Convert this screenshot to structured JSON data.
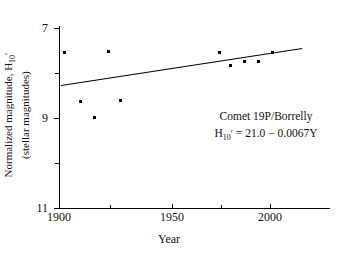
{
  "chart_data": {
    "type": "scatter",
    "title": "",
    "xlabel": "Year",
    "ylabel": "Normalized magnitude, H10' (stellar magnitudes)",
    "ylabel_line1": "Normalized magnitude, H",
    "ylabel_line1_sub": "10",
    "ylabel_line1_prime": "′",
    "ylabel_line2": "(stellar magnitudes)",
    "xlim": [
      1900,
      2022
    ],
    "ylim": [
      11,
      7
    ],
    "y_inverted": true,
    "grid": false,
    "legend": "none",
    "x_major_ticks": [
      1900,
      1950,
      2000
    ],
    "x_minor_ticks": [
      1925,
      1975
    ],
    "y_major_ticks": [
      7,
      9,
      11
    ],
    "y_minor_ticks": [
      8,
      10
    ],
    "x_tick_labels": [
      "1900",
      "1950",
      "2000"
    ],
    "y_tick_labels": [
      "7",
      "9",
      "11"
    ],
    "series": [
      {
        "name": "Normalized magnitude observations",
        "marker": "square",
        "color": "#000000",
        "points": [
          {
            "x": 1903,
            "y": 7.55
          },
          {
            "x": 1911,
            "y": 8.63
          },
          {
            "x": 1918,
            "y": 8.98
          },
          {
            "x": 1925,
            "y": 7.53
          },
          {
            "x": 1931,
            "y": 8.62
          },
          {
            "x": 1981,
            "y": 7.55
          },
          {
            "x": 1987,
            "y": 7.83
          },
          {
            "x": 1994,
            "y": 7.75
          },
          {
            "x": 2001,
            "y": 7.74
          },
          {
            "x": 2008,
            "y": 7.55
          }
        ]
      }
    ],
    "fit_line": {
      "name": "Linear regression",
      "equation": "H10' = 21.0 - 0.0067Y",
      "intercept": 21.0,
      "slope": -0.0067,
      "x_start": 1901,
      "x_end": 2023,
      "y_start": 8.27,
      "y_end": 7.45
    },
    "annotations": {
      "comet_name": "Comet 19P/Borrelly",
      "equation_lhs": "H",
      "equation_sub": "10",
      "equation_prime": "′",
      "equation_rhs": "= 21.0 − 0.0067Y"
    }
  }
}
